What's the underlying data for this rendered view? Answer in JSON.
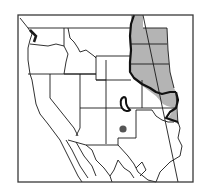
{
  "map": {
    "title": "Range map",
    "region": "Western North America",
    "frame_color": "#3a3a3a",
    "line_color": "#1a1a1a",
    "range_fill": "#b4b4b4",
    "range_border": "#111111",
    "point_color": "#555555",
    "features": [
      {
        "id": "main-range",
        "type": "shaded-area",
        "description": "Eastern Great Plains (Dakotas, Nebraska, Kansas, Oklahoma)"
      },
      {
        "id": "disjunct-population",
        "type": "outlined-area",
        "description": "Isolated population in southeastern Colorado"
      },
      {
        "id": "point-record",
        "type": "dot",
        "description": "Single record in New Mexico"
      }
    ]
  }
}
